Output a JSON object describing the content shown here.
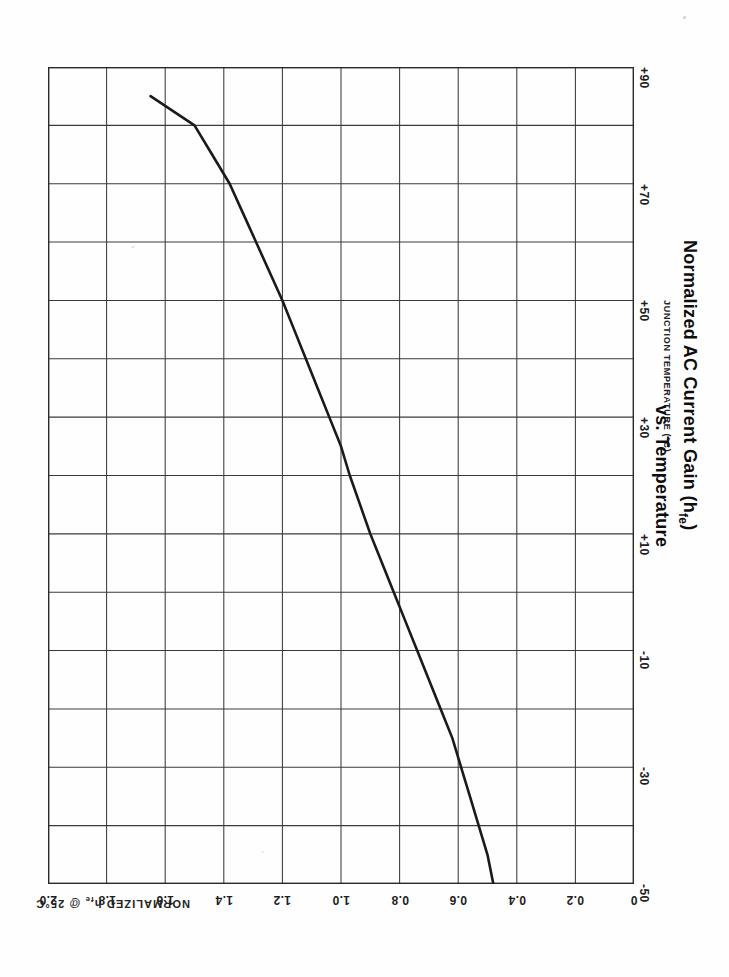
{
  "figure": {
    "title_line1": "Normalized AC Current Gain (h",
    "title_line1_sub": "fe",
    "title_line1_end": ")",
    "title_line2": "vs. Temperature",
    "temp_axis_title": "JUNCTION TEMPERATURE (°C)",
    "hfe_axis_title_pre": "NORMALIZED h",
    "hfe_axis_title_sub": "fe",
    "hfe_axis_title_post": " @ 25°C",
    "line_color": "#1a1a1a",
    "grid_color": "#3a3a3a",
    "frame_color": "#2a2a2a",
    "background_color": "#ffffff"
  },
  "chart_data": {
    "type": "line",
    "title": "Normalized AC Current Gain (hfe) vs. Temperature",
    "orientation": "rotated-90-cw",
    "xlabel": "JUNCTION TEMPERATURE (°C)",
    "ylabel": "NORMALIZED hfe @ 25°C",
    "xlim": [
      -50,
      90
    ],
    "ylim": [
      0,
      2.0
    ],
    "grid": true,
    "legend": null,
    "x_ticks": [
      -50,
      -30,
      -10,
      10,
      30,
      50,
      70,
      90
    ],
    "x_tick_labels": [
      "-50",
      "-30",
      "-10",
      "+10",
      "+30",
      "+50",
      "+70",
      "+90"
    ],
    "x_minor_step": 10,
    "y_ticks": [
      0,
      0.2,
      0.4,
      0.6,
      0.8,
      1.0,
      1.2,
      1.4,
      1.6,
      1.8,
      2.0
    ],
    "y_tick_labels": [
      "0",
      "0.2",
      "0.4",
      "0.6",
      "0.8",
      "1.0",
      "1.2",
      "1.4",
      "1.6",
      "1.8",
      "2.0"
    ],
    "series": [
      {
        "name": "Normalized hfe",
        "x": [
          -50,
          -45,
          -40,
          -35,
          -30,
          -25,
          -20,
          -15,
          -10,
          -5,
          0,
          5,
          10,
          15,
          20,
          25,
          30,
          35,
          40,
          45,
          50,
          55,
          60,
          65,
          70,
          75,
          80,
          85
        ],
        "values": [
          0.48,
          0.5,
          0.53,
          0.56,
          0.59,
          0.62,
          0.66,
          0.7,
          0.74,
          0.78,
          0.82,
          0.86,
          0.9,
          0.935,
          0.97,
          1.0,
          1.04,
          1.08,
          1.12,
          1.16,
          1.2,
          1.245,
          1.29,
          1.335,
          1.38,
          1.44,
          1.5,
          1.65
        ]
      }
    ]
  },
  "temp_axis": {
    "ticks": [
      {
        "label": "+90",
        "value": 90
      },
      {
        "label": "+70",
        "value": 70
      },
      {
        "label": "+50",
        "value": 50
      },
      {
        "label": "+30",
        "value": 30
      },
      {
        "label": "+10",
        "value": 10
      },
      {
        "label": "-10",
        "value": -10
      },
      {
        "label": "-30",
        "value": -30
      },
      {
        "label": "-50",
        "value": -50
      }
    ]
  },
  "hfe_axis": {
    "ticks": [
      {
        "label": "2.0",
        "value": 2.0
      },
      {
        "label": "1.8",
        "value": 1.8
      },
      {
        "label": "1.6",
        "value": 1.6
      },
      {
        "label": "1.4",
        "value": 1.4
      },
      {
        "label": "1.2",
        "value": 1.2
      },
      {
        "label": "1.0",
        "value": 1.0
      },
      {
        "label": "0.8",
        "value": 0.8
      },
      {
        "label": "0.6",
        "value": 0.6
      },
      {
        "label": "0.4",
        "value": 0.4
      },
      {
        "label": "0.2",
        "value": 0.2
      },
      {
        "label": "0",
        "value": 0.0
      }
    ]
  }
}
